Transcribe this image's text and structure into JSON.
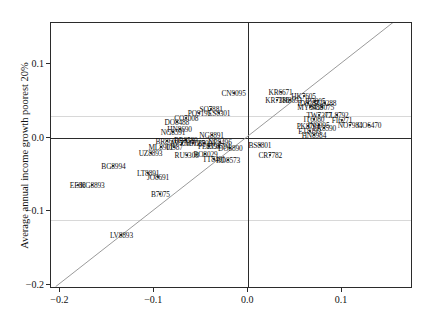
{
  "chart_data": {
    "type": "scatter",
    "title": "",
    "xlabel": "",
    "ylabel": "Average annual income growth poorest 20%",
    "xlim": [
      -0.21,
      0.1755
    ],
    "ylim": [
      -0.2055,
      0.1555
    ],
    "xticks": [
      -0.2,
      -0.1,
      0.0,
      0.1
    ],
    "xticklabels": [
      "−0.2",
      "−0.1",
      "0.0",
      "0.1"
    ],
    "yticks": [
      0.1,
      0.0,
      -0.1,
      -0.2
    ],
    "yticklabels": [
      "0.1",
      "0.0",
      "−0.1",
      "−0.2"
    ],
    "grid": false,
    "reference_line": {
      "name": "identity-line",
      "equation": "y = x",
      "from": [
        -0.205,
        -0.205
      ],
      "to": [
        0.1755,
        0.1755
      ],
      "color": "#999999"
    },
    "point_labels_shown": true,
    "points": [
      {
        "label": "CN9095",
        "x": -0.0155,
        "y": 0.06
      },
      {
        "label": "KR6671",
        "x": 0.0345,
        "y": 0.0625
      },
      {
        "label": "HK7605",
        "x": 0.059,
        "y": 0.056
      },
      {
        "label": "KR7386",
        "x": 0.031,
        "y": 0.051
      },
      {
        "label": "TH8693",
        "x": 0.0445,
        "y": 0.0505
      },
      {
        "label": "JP7905",
        "x": 0.071,
        "y": 0.05
      },
      {
        "label": "ID8287",
        "x": 0.064,
        "y": 0.047
      },
      {
        "label": "SG8288",
        "x": 0.0815,
        "y": 0.047
      },
      {
        "label": "SG8075",
        "x": 0.079,
        "y": 0.0415
      },
      {
        "label": "MY8489",
        "x": 0.066,
        "y": 0.041
      },
      {
        "label": "SO7881",
        "x": -0.0395,
        "y": 0.039
      },
      {
        "label": "PO9195",
        "x": -0.052,
        "y": 0.034
      },
      {
        "label": "ES8301",
        "x": -0.031,
        "y": 0.0335
      },
      {
        "label": "CO7008",
        "x": -0.066,
        "y": 0.0265
      },
      {
        "label": "DO8488",
        "x": -0.076,
        "y": 0.021
      },
      {
        "label": "CL8792",
        "x": 0.0945,
        "y": 0.03
      },
      {
        "label": "TW7377",
        "x": 0.0755,
        "y": 0.03
      },
      {
        "label": "IT6080",
        "x": 0.07,
        "y": 0.0255
      },
      {
        "label": "FI6271",
        "x": 0.1,
        "y": 0.024
      },
      {
        "label": "NO7984",
        "x": 0.1085,
        "y": 0.0175
      },
      {
        "label": "CO6470",
        "x": 0.129,
        "y": 0.0165
      },
      {
        "label": "IN9095",
        "x": 0.075,
        "y": 0.017
      },
      {
        "label": "PK8791",
        "x": 0.064,
        "y": 0.0155
      },
      {
        "label": "LK8590",
        "x": 0.081,
        "y": 0.0125
      },
      {
        "label": "ET8193",
        "x": 0.0655,
        "y": 0.009
      },
      {
        "label": "HN8984",
        "x": 0.07,
        "y": 0.003
      },
      {
        "label": "HN8690",
        "x": -0.073,
        "y": 0.012
      },
      {
        "label": "NG8591",
        "x": -0.08,
        "y": 0.0075
      },
      {
        "label": "NG8891",
        "x": -0.039,
        "y": 0.003
      },
      {
        "label": "BR8603",
        "x": -0.086,
        "y": -0.004
      },
      {
        "label": "BR8589",
        "x": -0.0665,
        "y": -0.003
      },
      {
        "label": "AV7789",
        "x": -0.071,
        "y": -0.0075
      },
      {
        "label": "ZM7089",
        "x": -0.059,
        "y": -0.0075
      },
      {
        "label": "TZ7091",
        "x": -0.047,
        "y": -0.0075
      },
      {
        "label": "NP8496",
        "x": -0.03,
        "y": -0.0065
      },
      {
        "label": "PE8594",
        "x": -0.0415,
        "y": -0.012
      },
      {
        "label": "EC8794",
        "x": -0.0315,
        "y": -0.012
      },
      {
        "label": "BS8801",
        "x": 0.0125,
        "y": -0.0105
      },
      {
        "label": "DO8890",
        "x": -0.019,
        "y": -0.014
      },
      {
        "label": "ML8901",
        "x": -0.093,
        "y": -0.013
      },
      {
        "label": "TJ987",
        "x": -0.079,
        "y": -0.013
      },
      {
        "label": "UZ8893",
        "x": -0.104,
        "y": -0.0215
      },
      {
        "label": "RU9308",
        "x": -0.0655,
        "y": -0.023
      },
      {
        "label": "RO8029",
        "x": -0.0455,
        "y": -0.0225
      },
      {
        "label": "CR7782",
        "x": 0.0235,
        "y": -0.0235
      },
      {
        "label": "TT8491",
        "x": -0.0365,
        "y": -0.029
      },
      {
        "label": "BD8573",
        "x": -0.0215,
        "y": -0.03
      },
      {
        "label": "BG8994",
        "x": -0.1435,
        "y": -0.039
      },
      {
        "label": "LT8891",
        "x": -0.1065,
        "y": -0.048
      },
      {
        "label": "JO8691",
        "x": -0.096,
        "y": -0.054
      },
      {
        "label": "EE88",
        "x": -0.1815,
        "y": -0.0645
      },
      {
        "label": "KG8893",
        "x": -0.166,
        "y": -0.0645
      },
      {
        "label": "B7075",
        "x": -0.0935,
        "y": -0.076
      },
      {
        "label": "LV8893",
        "x": -0.135,
        "y": -0.132
      }
    ]
  }
}
